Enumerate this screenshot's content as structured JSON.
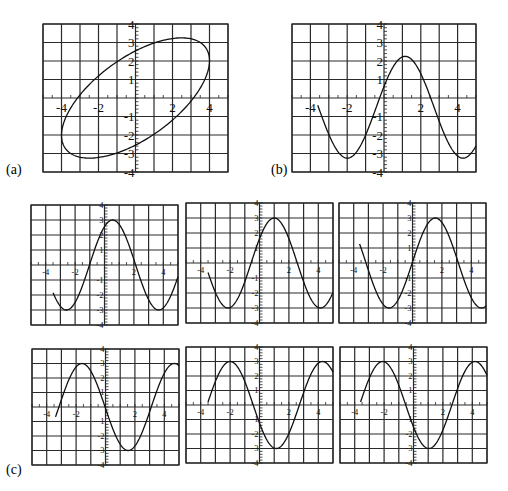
{
  "figure_labels": {
    "a": "(a)",
    "b": "(b)",
    "c": "(c)"
  },
  "chart_data": [
    {
      "id": "a",
      "type": "line",
      "panel_label": "(a)",
      "description": "closed ellipse (parametric)",
      "xlim": [
        -5,
        5
      ],
      "ylim": [
        -4,
        4
      ],
      "grid": true,
      "xticks_labeled": [
        "-4",
        "-2",
        "2",
        "4"
      ],
      "yticks_labeled": [
        "4",
        "3",
        "2",
        "1",
        "-1",
        "-2",
        "-3",
        "-4"
      ],
      "param": {
        "x_amp": 4,
        "x_phase": 0,
        "y_amp": 3.25,
        "y_phase": -0.9
      }
    },
    {
      "id": "b",
      "type": "line",
      "panel_label": "(b)",
      "description": "sinusoid",
      "xlim": [
        -5,
        5
      ],
      "ylim": [
        -4,
        4
      ],
      "grid": true,
      "xticks_labeled": [
        "-4",
        "-2",
        "2",
        "4"
      ],
      "yticks_labeled": [
        "4",
        "3",
        "2",
        "1",
        "-1",
        "-2",
        "-3",
        "-4"
      ],
      "x_start": -3.6,
      "x_end": 5,
      "wave": {
        "amp": 2.75,
        "offset": -0.5,
        "peak_x": 1.15,
        "period": 6.2832
      }
    },
    {
      "id": "c1",
      "type": "line",
      "panel_label": "",
      "xlim": [
        -5,
        5
      ],
      "ylim": [
        -4,
        4
      ],
      "grid": true,
      "xticks_labeled": [
        "-4",
        "-2",
        "2",
        "4"
      ],
      "yticks_labeled": [
        "4",
        "3",
        "2",
        "1",
        "-1",
        "-2",
        "-3",
        "-4"
      ],
      "x_start": -3.5,
      "x_end": 5,
      "wave": {
        "amp": 3,
        "offset": 0,
        "peak_x": 0.55,
        "period": 6.2832
      }
    },
    {
      "id": "c2",
      "type": "line",
      "panel_label": "",
      "xlim": [
        -5,
        5
      ],
      "ylim": [
        -4,
        4
      ],
      "grid": true,
      "xticks_labeled": [
        "-4",
        "-2",
        "2",
        "4"
      ],
      "yticks_labeled": [
        "4",
        "3",
        "2",
        "1",
        "-1",
        "-2",
        "-3",
        "-4"
      ],
      "x_start": -3.5,
      "x_end": 5,
      "wave": {
        "amp": 3,
        "offset": 0,
        "peak_x": 1.0,
        "period": 6.2832
      }
    },
    {
      "id": "c3",
      "type": "line",
      "panel_label": "",
      "xlim": [
        -5,
        5
      ],
      "ylim": [
        -4,
        4
      ],
      "grid": true,
      "xticks_labeled": [
        "-4",
        "-2",
        "2",
        "4"
      ],
      "yticks_labeled": [
        "4",
        "3",
        "2",
        "1",
        "-1",
        "-2",
        "-3",
        "-4"
      ],
      "x_start": -3.6,
      "x_end": 5,
      "wave": {
        "amp": 3,
        "offset": 0,
        "peak_x": 1.55,
        "period": 6.2832
      }
    },
    {
      "id": "c4",
      "type": "line",
      "panel_label": "(c)",
      "xlim": [
        -5,
        5
      ],
      "ylim": [
        -4,
        4
      ],
      "grid": true,
      "xticks_labeled": [
        "-4",
        "-2",
        "2",
        "4"
      ],
      "yticks_labeled": [
        "4",
        "3",
        "2",
        "1",
        "-1",
        "-2",
        "-3",
        "-4"
      ],
      "x_start": -3.4,
      "x_end": 5,
      "wave": {
        "amp": 3,
        "offset": 0,
        "peak_x": -1.6,
        "period": 6.2832
      }
    },
    {
      "id": "c5",
      "type": "line",
      "panel_label": "",
      "xlim": [
        -5,
        5
      ],
      "ylim": [
        -4,
        4
      ],
      "grid": true,
      "xticks_labeled": [
        "-4",
        "-2",
        "2",
        "4"
      ],
      "yticks_labeled": [
        "4",
        "3",
        "2",
        "1",
        "-1",
        "-2",
        "-3",
        "-4"
      ],
      "x_start": -3.5,
      "x_end": 5,
      "wave": {
        "amp": 3,
        "offset": 0,
        "peak_x": -2.0,
        "period": 6.2832
      }
    },
    {
      "id": "c6",
      "type": "line",
      "panel_label": "",
      "xlim": [
        -5,
        5
      ],
      "ylim": [
        -4,
        4
      ],
      "grid": true,
      "xticks_labeled": [
        "-4",
        "-2",
        "2",
        "4"
      ],
      "yticks_labeled": [
        "4",
        "3",
        "2",
        "1",
        "-1",
        "-2",
        "-3",
        "-4"
      ],
      "x_start": -3.6,
      "x_end": 5,
      "wave": {
        "amp": 3,
        "offset": 0,
        "peak_x": -2.1,
        "period": 6.2832
      }
    }
  ]
}
